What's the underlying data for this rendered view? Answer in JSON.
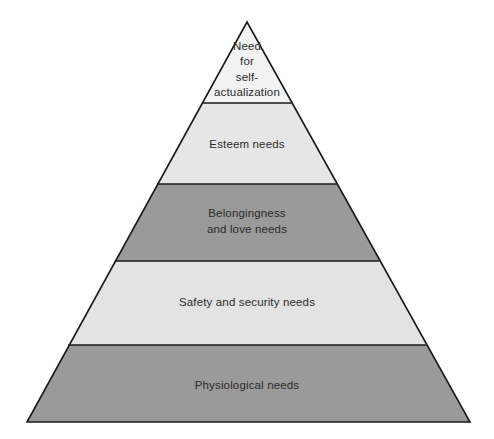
{
  "diagram": {
    "name": "maslow-hierarchy-of-needs-pyramid",
    "type": "pyramid",
    "background_color": "#ffffff",
    "outline_color": "#1a1a1a",
    "text_color": "#2b2b2b",
    "geometry": {
      "apex_x": 247,
      "apex_y": 22,
      "base_left_x": 27,
      "base_right_x": 470,
      "base_y": 422,
      "divider_y": [
        103,
        184,
        261,
        345
      ]
    },
    "tiers": [
      {
        "level": 5,
        "id": "self-actualization",
        "lines": [
          "Need",
          "for",
          "self-",
          "actualization"
        ],
        "fill": "#f2f2f2",
        "label_center_x": 247,
        "label_center_y": 70,
        "line_height": 15.5
      },
      {
        "level": 4,
        "id": "esteem",
        "lines": [
          "Esteem needs"
        ],
        "fill": "#e6e6e6",
        "label_center_x": 247,
        "label_center_y": 145,
        "line_height": 15.5
      },
      {
        "level": 3,
        "id": "belongingness-and-love",
        "lines": [
          "Belongingness",
          "and love needs"
        ],
        "fill": "#9a9a9a",
        "label_center_x": 247,
        "label_center_y": 222,
        "line_height": 16
      },
      {
        "level": 2,
        "id": "safety-and-security",
        "lines": [
          "Safety and security needs"
        ],
        "fill": "#e3e3e3",
        "label_center_x": 247,
        "label_center_y": 303,
        "line_height": 15.5
      },
      {
        "level": 1,
        "id": "physiological",
        "lines": [
          "Physiological needs"
        ],
        "fill": "#9a9a9a",
        "label_center_x": 247,
        "label_center_y": 386,
        "line_height": 15.5
      }
    ]
  }
}
